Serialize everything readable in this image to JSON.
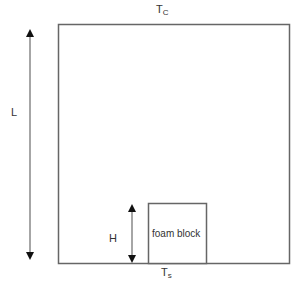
{
  "diagram": {
    "top_boundary_label": {
      "main": "T",
      "sub": "C"
    },
    "bottom_boundary_label": {
      "main": "T",
      "sub": "s"
    },
    "height_label": "L",
    "block_height_label": "H",
    "block_label": "foam block"
  },
  "colors": {
    "stroke": "#666666",
    "arrow": "#111111",
    "text": "#333333",
    "background": "#ffffff"
  }
}
